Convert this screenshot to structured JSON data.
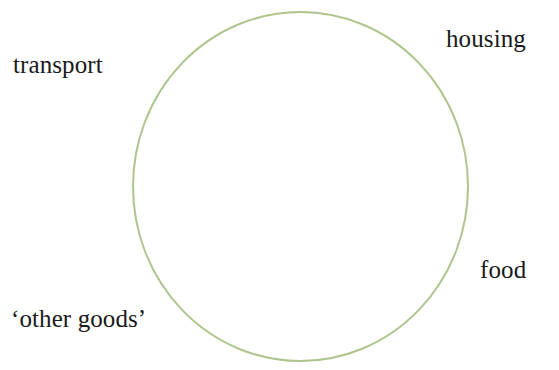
{
  "canvas": {
    "width": 559,
    "height": 370,
    "background": "#ffffff"
  },
  "diagram": {
    "type": "labelled-circle",
    "shape": {
      "name": "circle-outline",
      "kind": "ellipse",
      "center_x": 300.5,
      "center_y": 186.5,
      "radius_x": 167.5,
      "radius_y": 174.5,
      "stroke_color": "#aec58d",
      "stroke_width": 2,
      "fill": "none"
    },
    "labels": [
      {
        "id": "transport",
        "text": "transport",
        "position": "top-left",
        "x": 13,
        "y": 52
      },
      {
        "id": "housing",
        "text": "housing",
        "position": "top-right",
        "x": 446,
        "y": 26
      },
      {
        "id": "food",
        "text": "food",
        "position": "right",
        "x": 480,
        "y": 257
      },
      {
        "id": "other-goods",
        "text": "‘other goods’",
        "position": "bottom-left",
        "x": 11,
        "y": 306
      }
    ],
    "text_color": "#1a1a1a"
  }
}
